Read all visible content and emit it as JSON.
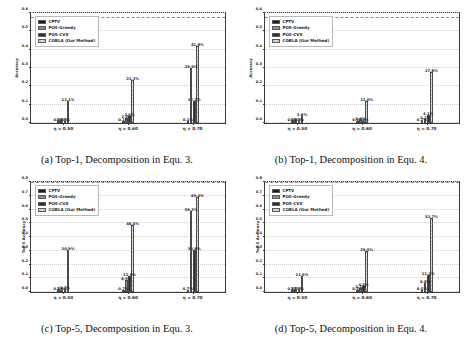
{
  "figure": {
    "series_labels": [
      "CPTV",
      "POS-Greedy",
      "POS-CVX",
      "COBLA (Our Method)"
    ],
    "series_colors": [
      "#1b1b1b",
      "#8e8e8e",
      "#2e2e2e",
      "#c9c9c9"
    ],
    "categories": [
      "η = 0.50",
      "η = 0.60",
      "η = 0.70"
    ]
  },
  "panels": [
    {
      "id": "a",
      "caption": "(a) Top-1, Decomposition in Equ. 3.",
      "chart_data": {
        "type": "bar",
        "title": "",
        "xlabel": "",
        "ylabel": "Accuracy",
        "ylim": [
          0.0,
          0.6
        ],
        "yticks": [
          "0.0",
          "0.1",
          "0.2",
          "0.3",
          "0.4",
          "0.5",
          "0.6"
        ],
        "grid": true,
        "legend": "upper left",
        "reference_line": 0.572,
        "categories": [
          "η = 0.50",
          "η = 0.60",
          "η = 0.70"
        ],
        "series": [
          {
            "name": "CPTV",
            "values": [
              0.001,
              0.001,
              0.001
            ],
            "labels": [
              "0.1%",
              "0.1%",
              "0.1%"
            ]
          },
          {
            "name": "POS-Greedy",
            "values": [
              0.003,
              0.029,
              0.299
            ],
            "labels": [
              "0.3%",
              "2.9%",
              "29.9%"
            ]
          },
          {
            "name": "POS-CVX",
            "values": [
              0.003,
              0.036,
              0.122
            ],
            "labels": [
              "0.3%",
              "3.6%",
              "12.2%"
            ]
          },
          {
            "name": "COBLA (Our Method)",
            "values": [
              0.121,
              0.233,
              0.418
            ],
            "labels": [
              "12.1%",
              "23.3%",
              "41.8%"
            ]
          }
        ]
      }
    },
    {
      "id": "b",
      "caption": "(b) Top-1, Decomposition in Equ. 4.",
      "chart_data": {
        "type": "bar",
        "title": "",
        "xlabel": "",
        "ylabel": "Accuracy",
        "ylim": [
          0.0,
          0.6
        ],
        "yticks": [
          "0.0",
          "0.1",
          "0.2",
          "0.3",
          "0.4",
          "0.5",
          "0.6"
        ],
        "grid": true,
        "legend": "upper left",
        "reference_line": 0.572,
        "categories": [
          "η = 0.50",
          "η = 0.60",
          "η = 0.70"
        ],
        "series": [
          {
            "name": "CPTV",
            "values": [
              0.001,
              0.001,
              0.002
            ],
            "labels": [
              "0.1%",
              "0.1%",
              "0.2%"
            ]
          },
          {
            "name": "POS-Greedy",
            "values": [
              0.003,
              0.014,
              0.022
            ],
            "labels": [
              "0.3%",
              "1.4%",
              "2.2%"
            ]
          },
          {
            "name": "POS-CVX",
            "values": [
              0.002,
              0.01,
              0.041
            ],
            "labels": [
              "0.2%",
              "1.0%",
              "4.1%"
            ]
          },
          {
            "name": "COBLA (Our Method)",
            "values": [
              0.038,
              0.12,
              0.278
            ],
            "labels": [
              "3.8%",
              "12.0%",
              "27.8%"
            ]
          }
        ]
      }
    },
    {
      "id": "c",
      "caption": "(c) Top-5, Decomposition in Equ. 3.",
      "chart_data": {
        "type": "bar",
        "title": "",
        "xlabel": "",
        "ylabel": "Top-5 Accuracy",
        "ylim": [
          0.0,
          0.8
        ],
        "yticks": [
          "0.0",
          "0.1",
          "0.2",
          "0.3",
          "0.4",
          "0.5",
          "0.6",
          "0.7",
          "0.8"
        ],
        "grid": true,
        "legend": "upper left",
        "reference_line": 0.795,
        "categories": [
          "η = 0.50",
          "η = 0.60",
          "η = 0.70"
        ],
        "series": [
          {
            "name": "CPTV",
            "values": [
              0.005,
              0.007,
              0.007
            ],
            "labels": [
              "0.5%",
              "0.7%",
              "0.7%"
            ]
          },
          {
            "name": "POS-Greedy",
            "values": [
              0.013,
              0.089,
              0.592
            ],
            "labels": [
              "1.3%",
              "8.9%",
              "59.2%"
            ]
          },
          {
            "name": "POS-CVX",
            "values": [
              0.023,
              0.119,
              0.308
            ],
            "labels": [
              "2.3%",
              "11.9%",
              "30.8%"
            ]
          },
          {
            "name": "COBLA (Our Method)",
            "values": [
              0.309,
              0.485,
              0.694
            ],
            "labels": [
              "30.9%",
              "48.5%",
              "69.4%"
            ]
          }
        ]
      }
    },
    {
      "id": "d",
      "caption": "(d) Top-5, Decomposition in Equ. 4.",
      "chart_data": {
        "type": "bar",
        "title": "",
        "xlabel": "",
        "ylabel": "Top-5 Accuracy",
        "ylim": [
          0.0,
          0.8
        ],
        "yticks": [
          "0.0",
          "0.1",
          "0.2",
          "0.3",
          "0.4",
          "0.5",
          "0.6",
          "0.7",
          "0.8"
        ],
        "grid": true,
        "legend": "upper left",
        "reference_line": 0.795,
        "categories": [
          "η = 0.50",
          "η = 0.60",
          "η = 0.70"
        ],
        "series": [
          {
            "name": "CPTV",
            "values": [
              0.005,
              0.005,
              0.005
            ],
            "labels": [
              "0.5%",
              "0.5%",
              "0.5%"
            ]
          },
          {
            "name": "POS-Greedy",
            "values": [
              0.017,
              0.031,
              0.068
            ],
            "labels": [
              "1.7%",
              "3.1%",
              "6.8%"
            ]
          },
          {
            "name": "POS-CVX",
            "values": [
              0.012,
              0.044,
              0.122
            ],
            "labels": [
              "1.2%",
              "4.4%",
              "12.2%"
            ]
          },
          {
            "name": "COBLA (Our Method)",
            "values": [
              0.119,
              0.295,
              0.537
            ],
            "labels": [
              "11.9%",
              "29.5%",
              "53.7%"
            ]
          }
        ]
      }
    }
  ]
}
